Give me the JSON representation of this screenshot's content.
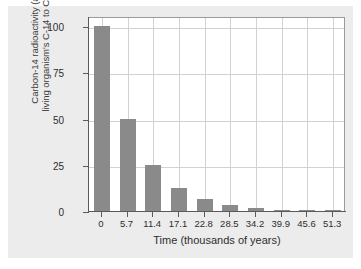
{
  "chart_data": {
    "type": "bar",
    "title": "",
    "xlabel": "Time (thousands of years)",
    "ylabel_line1": "Carbon-14 radioactivity (as % of",
    "ylabel_line2": "living organism's C-14 to C-12 ratio)",
    "categories": [
      "0",
      "5.7",
      "11.4",
      "17.1",
      "22.8",
      "28.5",
      "34.2",
      "39.9",
      "45.6",
      "51.3"
    ],
    "values": [
      100,
      50,
      25,
      12.5,
      6.25,
      3.125,
      1.5625,
      0.78125,
      0.390625,
      0.1953125
    ],
    "ytick_labels": [
      "0",
      "25",
      "50",
      "75",
      "100"
    ],
    "ytick_values": [
      0,
      25,
      50,
      75,
      100
    ],
    "ylim": [
      0,
      100
    ],
    "grid": "both",
    "legend": "none",
    "bar_color": "#8a8a8a",
    "plot_background": "#ffffff",
    "figure_background": "#ececec",
    "grid_color": "#d2d2d2",
    "axis_color": "#5a5a5a"
  }
}
